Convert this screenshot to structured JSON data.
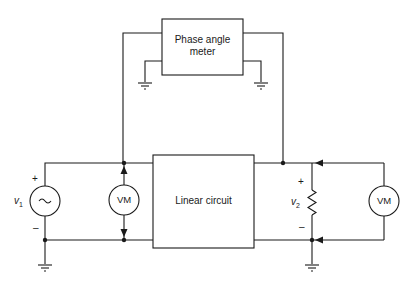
{
  "diagram": {
    "type": "circuit-schematic",
    "blocks": {
      "phase_meter": {
        "line1": "Phase angle",
        "line2": "meter"
      },
      "linear_circuit": {
        "label": "Linear circuit"
      }
    },
    "meters": {
      "left": {
        "label": "VM"
      },
      "right": {
        "label": "VM"
      }
    },
    "source": {
      "name": "v",
      "subscript": "1",
      "symbol": "~",
      "plus": "+",
      "minus": "–"
    },
    "load": {
      "name": "v",
      "subscript": "2",
      "plus": "+",
      "minus": "–"
    },
    "colors": {
      "line": "#1a1a1a",
      "background": "#ffffff"
    }
  }
}
